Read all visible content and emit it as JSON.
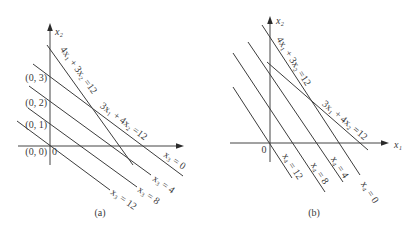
{
  "colors": {
    "background": "#ffffff",
    "line": "#3c3c3c",
    "text": "#3a3a3a"
  },
  "figure": {
    "panels": [
      {
        "id": "a",
        "caption": "(a)",
        "axes": {
          "y_label": "x₂",
          "origin_label": "0"
        },
        "point_labels": [
          "(0, 3)",
          "(0, 2)",
          "(0, 1)",
          "(0, 0)"
        ],
        "constraint_labels": [
          "4x₁ + 3x₂ =12",
          "3x₁ + 4x₂ =12"
        ],
        "level_lines": [
          {
            "label": "x₃ = 0"
          },
          {
            "label": "x₃ = 4"
          },
          {
            "label": "x₃ = 8"
          },
          {
            "label": "x₃ = 12"
          }
        ]
      },
      {
        "id": "b",
        "caption": "(b)",
        "axes": {
          "x_label": "x₁",
          "y_label": "x₂",
          "origin_label": "0"
        },
        "constraint_labels": [
          "4x₁ + 3x₂ =12",
          "3x₁ + 4x₂ =12"
        ],
        "level_lines": [
          {
            "label": "x₄ = 12"
          },
          {
            "label": "x₄ = 8"
          },
          {
            "label": "x₄ = 4"
          },
          {
            "label": "x₄ = 0"
          }
        ]
      }
    ]
  }
}
